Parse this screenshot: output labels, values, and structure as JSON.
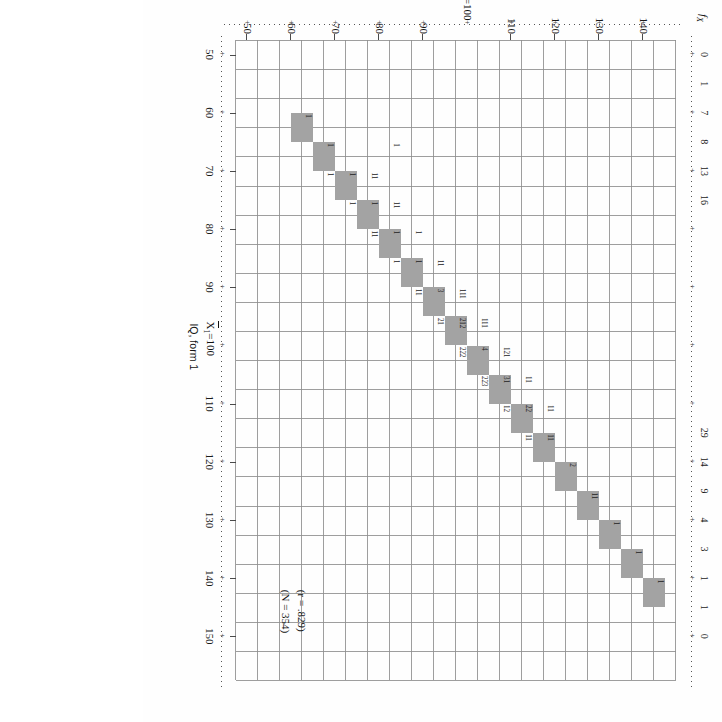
{
  "figure": {
    "kind": "bivariate-frequency-scatterplot",
    "annotations": {
      "correlation": "(r = .829)",
      "sample_size": "(N = 354)"
    },
    "x_axis": {
      "title": "IQ, form 1",
      "mean_label": "X̄1 = 100",
      "mean_symbol": "X",
      "mean_subscript": "1",
      "mean_value": "100",
      "ticks": [
        "50",
        "60",
        "70",
        "80",
        "90",
        "",
        "110",
        "120",
        "130",
        "140",
        "150"
      ],
      "tick_values": [
        50,
        60,
        70,
        80,
        90,
        100,
        110,
        120,
        130,
        140,
        150
      ],
      "min": 47.5,
      "max": 157.5
    },
    "y_axis": {
      "title": "IQ, form 2",
      "mean_label": "X̄2 = 100",
      "mean_symbol": "X",
      "mean_subscript": "2",
      "mean_value": "100",
      "ticks": [
        "50",
        "60",
        "70",
        "80",
        "90",
        "",
        "110",
        "120",
        "130",
        "140"
      ],
      "tick_values": [
        50,
        60,
        70,
        80,
        90,
        100,
        110,
        120,
        130,
        140
      ],
      "min": 47.5,
      "max": 147.5
    },
    "margin_row": {
      "label": "f",
      "label_subscript": "X",
      "label_full": "fX",
      "values": [
        "0",
        "1",
        "7",
        "8",
        "13",
        "16",
        "",
        "",
        "",
        "",
        "",
        "",
        "",
        "29",
        "14",
        "9",
        "4",
        "3",
        "1",
        "1",
        "0"
      ]
    }
  },
  "chart_data": {
    "type": "scatter",
    "title": "",
    "xlabel": "IQ, form 1",
    "ylabel": "IQ, form 2",
    "xlim": [
      47.5,
      157.5
    ],
    "ylim": [
      47.5,
      147.5
    ],
    "grid": true,
    "bin_width": 5,
    "annotations": [
      "(r = .829)",
      "(N = 354)"
    ],
    "correlation_r": 0.829,
    "n": 354,
    "x_mean": 100,
    "y_mean": 100,
    "x_ticks": [
      50,
      60,
      70,
      80,
      90,
      100,
      110,
      120,
      130,
      140,
      150
    ],
    "y_ticks": [
      50,
      60,
      70,
      80,
      90,
      100,
      110,
      120,
      130,
      140
    ],
    "diagonal_shaded_bins": [
      [
        60,
        60
      ],
      [
        65,
        65
      ],
      [
        70,
        70
      ],
      [
        75,
        75
      ],
      [
        80,
        80
      ],
      [
        85,
        85
      ],
      [
        90,
        90
      ],
      [
        95,
        95
      ],
      [
        100,
        100
      ],
      [
        105,
        105
      ],
      [
        110,
        110
      ],
      [
        115,
        115
      ],
      [
        120,
        120
      ],
      [
        125,
        125
      ],
      [
        130,
        130
      ],
      [
        135,
        135
      ],
      [
        140,
        140
      ]
    ],
    "x_marginal_frequencies": {
      "50": 0,
      "55": 1,
      "60": 7,
      "65": 8,
      "70": 13,
      "75": 16,
      "120": 29,
      "125": 14,
      "130": 9,
      "135": 4,
      "140": 3,
      "145": 1,
      "150": 1,
      "155": 0
    },
    "cells": [
      {
        "x": 60,
        "y": 60,
        "n": "1"
      },
      {
        "x": 65,
        "y": 65,
        "n": "1"
      },
      {
        "x": 70,
        "y": 65,
        "n": "1"
      },
      {
        "x": 70,
        "y": 70,
        "n": "1"
      },
      {
        "x": 70,
        "y": 75,
        "n": "11"
      },
      {
        "x": 65,
        "y": 80,
        "n": "1"
      },
      {
        "x": 75,
        "y": 70,
        "n": "1"
      },
      {
        "x": 75,
        "y": 75,
        "n": "1"
      },
      {
        "x": 75,
        "y": 80,
        "n": "11"
      },
      {
        "x": 80,
        "y": 75,
        "n": "11"
      },
      {
        "x": 80,
        "y": 80,
        "n": "1"
      },
      {
        "x": 80,
        "y": 85,
        "n": "1"
      },
      {
        "x": 85,
        "y": 80,
        "n": "1"
      },
      {
        "x": 85,
        "y": 85,
        "n": "1"
      },
      {
        "x": 85,
        "y": 90,
        "n": "11"
      },
      {
        "x": 90,
        "y": 85,
        "n": "11"
      },
      {
        "x": 90,
        "y": 90,
        "n": "3"
      },
      {
        "x": 90,
        "y": 95,
        "n": "111"
      },
      {
        "x": 95,
        "y": 90,
        "n": "21"
      },
      {
        "x": 95,
        "y": 95,
        "n": "212"
      },
      {
        "x": 95,
        "y": 100,
        "n": "111"
      },
      {
        "x": 100,
        "y": 95,
        "n": "222"
      },
      {
        "x": 100,
        "y": 100,
        "n": "4"
      },
      {
        "x": 100,
        "y": 105,
        "n": "121"
      },
      {
        "x": 105,
        "y": 100,
        "n": "223"
      },
      {
        "x": 105,
        "y": 105,
        "n": "31"
      },
      {
        "x": 105,
        "y": 110,
        "n": "11"
      },
      {
        "x": 110,
        "y": 105,
        "n": "12"
      },
      {
        "x": 110,
        "y": 110,
        "n": "22"
      },
      {
        "x": 110,
        "y": 115,
        "n": "11"
      },
      {
        "x": 115,
        "y": 110,
        "n": "11"
      },
      {
        "x": 115,
        "y": 115,
        "n": "11"
      },
      {
        "x": 120,
        "y": 120,
        "n": "2"
      },
      {
        "x": 125,
        "y": 125,
        "n": "11"
      },
      {
        "x": 130,
        "y": 130,
        "n": "1"
      },
      {
        "x": 135,
        "y": 135,
        "n": "1"
      },
      {
        "x": 140,
        "y": 140,
        "n": "1"
      }
    ]
  }
}
